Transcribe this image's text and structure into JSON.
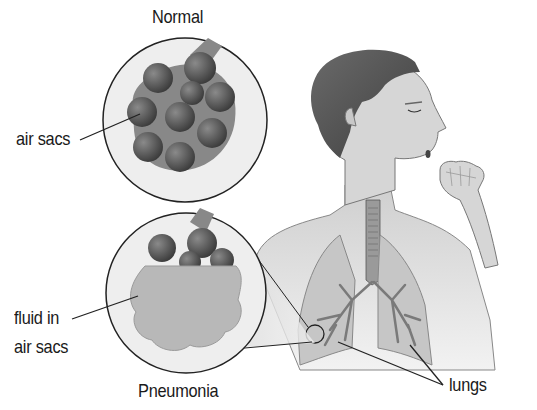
{
  "diagram": {
    "labels": {
      "normal_title": "Normal",
      "pneumonia_title": "Pneumonia",
      "air_sacs": "air sacs",
      "fluid_line1": "fluid in",
      "fluid_line2": "air sacs",
      "lungs": "lungs"
    },
    "panels": [
      {
        "name": "normal-inset",
        "caption": "Normal",
        "content": "cluster of healthy air sacs (alveoli)"
      },
      {
        "name": "pneumonia-inset",
        "caption": "Pneumonia",
        "content": "air sacs filled with fluid"
      }
    ],
    "figure": "person coughing into fist with lungs and bronchial tree shown",
    "colors": {
      "alveoli": "#555555",
      "fluid": "#b0b0b0",
      "skin": "#d8d8d8",
      "hair": "#5a5a5a",
      "lung": "#bdbdbd",
      "bronchi": "#7a7a7a",
      "outline": "#222222"
    }
  }
}
